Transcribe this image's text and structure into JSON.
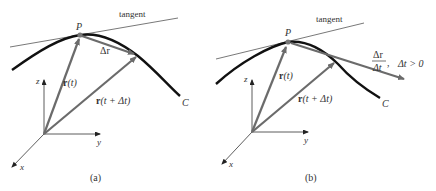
{
  "colors": {
    "curve": "#111111",
    "vector": "#6b6b6b",
    "tangent": "#555555",
    "axis": "#333333",
    "text": "#333333",
    "background": "#ffffff"
  },
  "panel_a": {
    "caption": "(a)",
    "tangent_label": "tangent",
    "point_label": "P",
    "curve_label": "C",
    "delta_r_label": "Δr",
    "r_t_label_bold": "r",
    "r_t_label_rest": "(t)",
    "r_t_dt_label_bold": "r",
    "r_t_dt_label_rest": "(t + Δt)",
    "axis_z": "z",
    "axis_y": "y",
    "axis_x": "x"
  },
  "panel_b": {
    "caption": "(b)",
    "tangent_label": "tangent",
    "point_label": "P",
    "curve_label": "C",
    "ratio_numerator": "Δr",
    "ratio_denominator": "Δt",
    "ratio_comma": ",",
    "condition": "Δt > 0",
    "r_t_label_bold": "r",
    "r_t_label_rest": "(t)",
    "r_t_dt_label_bold": "r",
    "r_t_dt_label_rest": "(t + Δt)",
    "axis_z": "z",
    "axis_y": "y",
    "axis_x": "x"
  }
}
